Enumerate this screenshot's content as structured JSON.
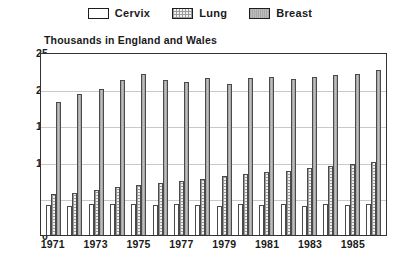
{
  "legend": {
    "items": [
      {
        "label": "Cervix",
        "swatch": "cervix-swatch",
        "color": "#ffffff"
      },
      {
        "label": "Lung",
        "swatch": "lung-swatch",
        "color": "#f2f2f2"
      },
      {
        "label": "Breast",
        "swatch": "breast-swatch",
        "color": "#b4b4b4"
      }
    ]
  },
  "chart_data": {
    "type": "bar",
    "title": "Thousands in England and Wales",
    "xlabel": "",
    "ylabel": "",
    "ylim": [
      0,
      25
    ],
    "yticks": [
      0,
      5,
      10,
      15,
      20,
      25
    ],
    "grid": true,
    "legend_position": "top",
    "categories": [
      "1971",
      "1972",
      "1973",
      "1974",
      "1975",
      "1976",
      "1977",
      "1978",
      "1979",
      "1980",
      "1981",
      "1982",
      "1983",
      "1984",
      "1985",
      "1986"
    ],
    "xtick_labels": [
      "1971",
      "1973",
      "1975",
      "1977",
      "1979",
      "1981",
      "1983",
      "1985"
    ],
    "series": [
      {
        "name": "Cervix",
        "values": [
          4.1,
          4.0,
          4.2,
          4.3,
          4.2,
          4.1,
          4.2,
          4.1,
          3.9,
          4.2,
          4.1,
          4.2,
          4.0,
          4.2,
          4.1,
          4.2
        ]
      },
      {
        "name": "Lung",
        "values": [
          5.6,
          5.8,
          6.2,
          6.6,
          6.9,
          7.1,
          7.4,
          7.7,
          8.0,
          8.3,
          8.6,
          8.8,
          9.1,
          9.4,
          9.7,
          10.0
        ]
      },
      {
        "name": "Breast",
        "values": [
          18.2,
          19.2,
          20.0,
          21.2,
          22.0,
          21.2,
          20.9,
          21.4,
          20.6,
          21.4,
          21.6,
          21.3,
          21.6,
          21.8,
          22.0,
          22.5
        ]
      }
    ]
  },
  "caption": {
    "text": ""
  }
}
